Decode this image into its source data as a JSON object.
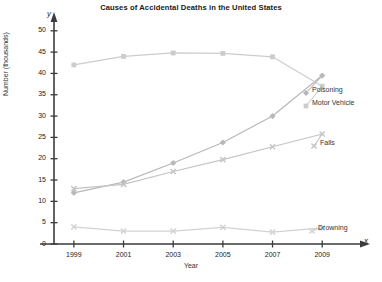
{
  "chart_data": {
    "type": "line",
    "title": "Causes of Accidental Deaths in the United States",
    "xlabel": "Year",
    "ylabel": "Number (thousands)",
    "x_axis_letter": "x",
    "y_axis_letter": "y",
    "categories": [
      1999,
      2001,
      2003,
      2005,
      2007,
      2009
    ],
    "xtick_labels": [
      "1999",
      "2001",
      "2003",
      "2005",
      "2007",
      "2009"
    ],
    "ytick_labels": [
      "0",
      "5",
      "10",
      "15",
      "20",
      "25",
      "30",
      "35",
      "40",
      "45",
      "50"
    ],
    "yticks": [
      0,
      5,
      10,
      15,
      20,
      25,
      30,
      35,
      40,
      45,
      50
    ],
    "ylim": [
      0,
      53
    ],
    "xlim": [
      1998.2,
      2010.2
    ],
    "grid": false,
    "legend_position": "right",
    "series": [
      {
        "name": "Poisoning",
        "color": "#b8b8b8",
        "marker": "diamond",
        "x": [
          1999,
          2001,
          2003,
          2005,
          2007,
          2009
        ],
        "values": [
          12,
          14.5,
          19,
          23.8,
          30,
          39.5
        ]
      },
      {
        "name": "Motor Vehicle",
        "color": "#cccccc",
        "marker": "square",
        "x": [
          1999,
          2001,
          2003,
          2005,
          2007,
          2009
        ],
        "values": [
          42,
          44,
          44.8,
          44.7,
          43.9,
          37
        ]
      },
      {
        "name": "Falls",
        "color": "#c4c4c4",
        "marker": "x",
        "x": [
          1999,
          2001,
          2003,
          2005,
          2007,
          2009
        ],
        "values": [
          13,
          14,
          17,
          19.8,
          22.8,
          25.8
        ]
      },
      {
        "name": "Drowning",
        "color": "#d2d2d2",
        "marker": "x",
        "x": [
          1999,
          2001,
          2003,
          2005,
          2007,
          2009
        ],
        "values": [
          4,
          3,
          3,
          3.9,
          2.8,
          3.8
        ]
      }
    ],
    "legend_entries": [
      {
        "label": "Poisoning",
        "x": 312,
        "y": 90
      },
      {
        "label": "Motor Vehicle",
        "x": 312,
        "y": 103
      },
      {
        "label": "Falls",
        "x": 320,
        "y": 143
      },
      {
        "label": "Drowning",
        "x": 318,
        "y": 228
      }
    ]
  },
  "axis_colors": {
    "axis_line": "#3b3b3b",
    "series_default": "#c6c6c6"
  }
}
